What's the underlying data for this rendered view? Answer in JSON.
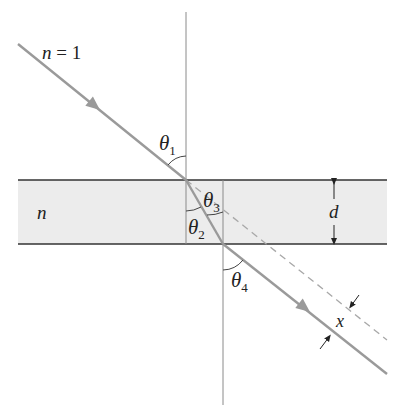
{
  "diagram": {
    "colors": {
      "background": "#ffffff",
      "slab_fill": "#ececec",
      "slab_border": "#333333",
      "ray": "#9a9a9a",
      "normal": "#8a8a8a",
      "dashed": "#a8a8a8",
      "text": "#222222"
    },
    "labels": {
      "outside_medium": "n = 1",
      "outside_n": "n",
      "outside_eq": " = 1",
      "slab_medium": "n",
      "theta1": "θ",
      "theta1_sub": "1",
      "theta2": "θ",
      "theta2_sub": "2",
      "theta3": "θ",
      "theta3_sub": "3",
      "theta4": "θ",
      "theta4_sub": "4",
      "thickness": "d",
      "displacement": "x"
    },
    "geometry": {
      "slab_top_y": 180,
      "slab_bottom_y": 244,
      "slab_left_x": 18,
      "slab_right_x": 387,
      "entry_point": [
        186,
        180
      ],
      "exit_point": [
        223,
        244
      ],
      "incident_start": [
        18,
        44
      ],
      "exit_end": [
        387,
        374
      ],
      "dashed_end": [
        387,
        340
      ]
    }
  }
}
